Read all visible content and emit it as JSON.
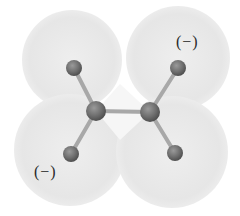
{
  "diagram": {
    "type": "molecular-electrostatic-potential-model",
    "colors": {
      "background": "#ffffff",
      "lobe_fill": "#e9e9e9",
      "lobe_fill_light": "#f2f2f2",
      "atom_fill": "#6f6f6f",
      "atom_highlight": "#9a9a9a",
      "bond": "#a8a8a8",
      "label": "#2a2a2a"
    },
    "lobes": [
      {
        "name": "top-left",
        "cx": 72,
        "cy": 60,
        "r": 50
      },
      {
        "name": "top-right",
        "cx": 178,
        "cy": 58,
        "r": 52
      },
      {
        "name": "bottom-left",
        "cx": 70,
        "cy": 150,
        "r": 56
      },
      {
        "name": "bottom-right",
        "cx": 172,
        "cy": 152,
        "r": 56
      }
    ],
    "atoms": [
      {
        "name": "terminal-top-left",
        "cx": 74,
        "cy": 68,
        "r": 8
      },
      {
        "name": "terminal-top-right",
        "cx": 178,
        "cy": 68,
        "r": 8
      },
      {
        "name": "center-left",
        "cx": 96,
        "cy": 111,
        "r": 10
      },
      {
        "name": "center-right",
        "cx": 150,
        "cy": 112,
        "r": 10
      },
      {
        "name": "terminal-bottom-left",
        "cx": 71,
        "cy": 154,
        "r": 8
      },
      {
        "name": "terminal-bottom-right",
        "cx": 175,
        "cy": 153,
        "r": 8
      }
    ],
    "bonds": [
      {
        "from": "terminal-top-left",
        "to": "center-left"
      },
      {
        "from": "center-left",
        "to": "center-right"
      },
      {
        "from": "center-right",
        "to": "terminal-top-right"
      },
      {
        "from": "center-left",
        "to": "terminal-bottom-left"
      },
      {
        "from": "center-right",
        "to": "terminal-bottom-right"
      }
    ],
    "labels": {
      "top_right_charge": "(−)",
      "bottom_left_charge": "(−)"
    }
  }
}
